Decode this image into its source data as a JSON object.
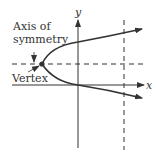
{
  "diagram": {
    "labels": {
      "axis_of_symmetry_line1": "Axis of",
      "axis_of_symmetry_line2": "symmetry",
      "vertex": "Vertex",
      "x_axis": "x",
      "y_axis": "y"
    },
    "colors": {
      "stroke": "#333333",
      "background": "#ffffff"
    }
  }
}
